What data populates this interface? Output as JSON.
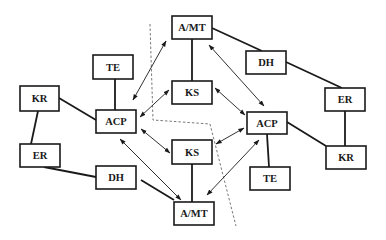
{
  "diagram": {
    "nodes": {
      "amt_top": {
        "label": "A/MT",
        "x": 172,
        "y": 16,
        "w": 40,
        "h": 23
      },
      "te_left": {
        "label": "TE",
        "x": 93,
        "y": 55,
        "w": 40,
        "h": 24
      },
      "dh_right": {
        "label": "DH",
        "x": 246,
        "y": 51,
        "w": 40,
        "h": 23
      },
      "kr_left": {
        "label": "KR",
        "x": 20,
        "y": 86,
        "w": 39,
        "h": 25
      },
      "ks_top": {
        "label": "KS",
        "x": 172,
        "y": 81,
        "w": 40,
        "h": 23
      },
      "er_right": {
        "label": "ER",
        "x": 325,
        "y": 88,
        "w": 40,
        "h": 23
      },
      "acp_left": {
        "label": "ACP",
        "x": 96,
        "y": 110,
        "w": 40,
        "h": 23
      },
      "acp_right": {
        "label": "ACP",
        "x": 247,
        "y": 112,
        "w": 40,
        "h": 22
      },
      "ks_bottom": {
        "label": "KS",
        "x": 172,
        "y": 140,
        "w": 40,
        "h": 24
      },
      "er_left": {
        "label": "ER",
        "x": 20,
        "y": 144,
        "w": 40,
        "h": 23
      },
      "kr_right": {
        "label": "KR",
        "x": 326,
        "y": 146,
        "w": 40,
        "h": 23
      },
      "dh_left": {
        "label": "DH",
        "x": 96,
        "y": 166,
        "w": 40,
        "h": 23
      },
      "te_right": {
        "label": "TE",
        "x": 250,
        "y": 167,
        "w": 40,
        "h": 23
      },
      "amt_bottom": {
        "label": "A/MT",
        "x": 174,
        "y": 202,
        "w": 40,
        "h": 23
      }
    },
    "solid_links": [
      [
        "amt_top",
        "ks_top"
      ],
      [
        "amt_top",
        "dh_right"
      ],
      [
        "dh_right",
        "er_right"
      ],
      [
        "er_right",
        "kr_right"
      ],
      [
        "kr_right",
        "acp_right"
      ],
      [
        "acp_right",
        "te_right"
      ],
      [
        "te_left",
        "acp_left"
      ],
      [
        "kr_left",
        "acp_left"
      ],
      [
        "kr_left",
        "er_left"
      ],
      [
        "er_left",
        "dh_left"
      ],
      [
        "dh_left",
        "amt_bottom"
      ],
      [
        "ks_bottom",
        "amt_bottom"
      ]
    ],
    "bidirectional_arrows": [
      [
        "acp_left",
        "amt_top"
      ],
      [
        "acp_left",
        "ks_top"
      ],
      [
        "acp_left",
        "ks_bottom"
      ],
      [
        "acp_left",
        "amt_bottom"
      ],
      [
        "amt_top",
        "acp_right"
      ],
      [
        "ks_top",
        "acp_right"
      ],
      [
        "ks_bottom",
        "acp_right"
      ],
      [
        "amt_bottom",
        "acp_right"
      ]
    ],
    "boundary": "dashed partition line separating left and right domains"
  }
}
